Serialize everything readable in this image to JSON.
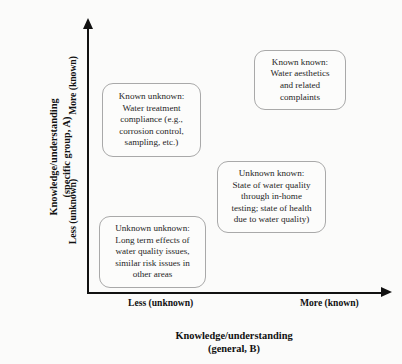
{
  "chart_data": {
    "type": "scatter",
    "title": "",
    "xlabel": "Knowledge/understanding\n(general, B)",
    "ylabel": "Knowledge/understanding\n(specific group, A)",
    "x_ticks": [
      "Less (unknown)",
      "More (known)"
    ],
    "y_ticks": [
      "Less (unknown)",
      "More (known)"
    ],
    "grid": false,
    "legend": "none",
    "quadrants": [
      {
        "id": "known-unknown",
        "x_level": "Less (unknown)",
        "y_level": "More (known)",
        "text": "Known unknown:\nWater treatment\ncompliance (e.g.,\ncorrosion control,\nsampling, etc.)"
      },
      {
        "id": "known-known",
        "x_level": "More (known)",
        "y_level": "More (known)",
        "text": "Known known:\nWater aesthetics\nand related\ncomplaints"
      },
      {
        "id": "unknown-known",
        "x_level": "More (known)",
        "y_level": "Less (unknown)",
        "text": "Unknown known:\nState of water quality\nthrough in-home\ntesting; state of health\ndue to water quality)"
      },
      {
        "id": "unknown-unknown",
        "x_level": "Less (unknown)",
        "y_level": "Less (unknown)",
        "text": "Unknown unknown:\nLong term effects of\nwater quality issues,\nsimilar risk issues in\nother areas"
      }
    ]
  },
  "axes": {
    "y": {
      "title": "Knowledge/understanding\n(specific group, A)",
      "tick_low": "Less (unknown)",
      "tick_high": "More (known)"
    },
    "x": {
      "title": "Knowledge/understanding\n(general, B)",
      "tick_low": "Less (unknown)",
      "tick_high": "More (known)"
    }
  },
  "boxes": {
    "known_unknown": "Known unknown:\nWater treatment\ncompliance (e.g.,\ncorrosion control,\nsampling, etc.)",
    "known_known": "Known known:\nWater aesthetics\nand related\ncomplaints",
    "unknown_known": "Unknown known:\nState of water quality\nthrough in-home\ntesting; state of health\ndue to water quality)",
    "unknown_unknown": "Unknown unknown:\nLong term effects of\nwater quality issues,\nsimilar risk issues in\nother areas"
  },
  "colors": {
    "background": "#fbfbfa",
    "axis": "#111111",
    "box_border": "#a9a9a9",
    "box_fill": "#fcfcfb",
    "text": "#1a1a1a"
  }
}
